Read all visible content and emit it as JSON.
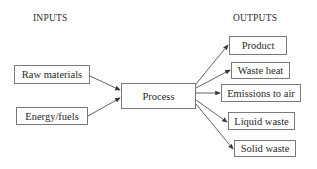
{
  "diagram": {
    "headings": {
      "inputs": "INPUTS",
      "outputs": "OUTPUTS"
    },
    "inputs": [
      {
        "label": "Raw materials"
      },
      {
        "label": "Energy/fuels"
      }
    ],
    "process": {
      "label": "Process"
    },
    "outputs": [
      {
        "label": "Product"
      },
      {
        "label": "Waste heat"
      },
      {
        "label": "Emissions to air"
      },
      {
        "label": "Liquid waste"
      },
      {
        "label": "Solid waste"
      }
    ],
    "colors": {
      "line": "#3a3a3a",
      "border": "#7a7a7a",
      "text": "#2a2a2a"
    }
  }
}
